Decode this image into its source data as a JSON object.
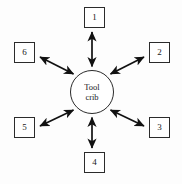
{
  "diagram": {
    "type": "star-network",
    "title": "",
    "background_color": "#fdfdfd",
    "line_color": "#1a1a1a",
    "box_fill": "#ffffff",
    "hub": {
      "shape": "circle",
      "label_line1": "Tool",
      "label_line2": "crib",
      "center_x": 92,
      "center_y": 92,
      "radius": 22
    },
    "nodes": [
      {
        "id": "node-1",
        "label": "1",
        "position": "north",
        "x": 94,
        "y": 18
      },
      {
        "id": "node-2",
        "label": "2",
        "position": "north-east",
        "x": 159,
        "y": 53
      },
      {
        "id": "node-3",
        "label": "3",
        "position": "south-east",
        "x": 159,
        "y": 128
      },
      {
        "id": "node-4",
        "label": "4",
        "position": "south",
        "x": 94,
        "y": 163
      },
      {
        "id": "node-5",
        "label": "5",
        "position": "south-west",
        "x": 24,
        "y": 128
      },
      {
        "id": "node-6",
        "label": "6",
        "position": "north-west",
        "x": 24,
        "y": 53
      }
    ],
    "connectors": [
      {
        "id": "edge-hub-1",
        "from": "hub",
        "to": "node-1",
        "arrow": "double"
      },
      {
        "id": "edge-hub-2",
        "from": "hub",
        "to": "node-2",
        "arrow": "double"
      },
      {
        "id": "edge-hub-3",
        "from": "hub",
        "to": "node-3",
        "arrow": "double"
      },
      {
        "id": "edge-hub-4",
        "from": "hub",
        "to": "node-4",
        "arrow": "double"
      },
      {
        "id": "edge-hub-5",
        "from": "hub",
        "to": "node-5",
        "arrow": "double"
      },
      {
        "id": "edge-hub-6",
        "from": "hub",
        "to": "node-6",
        "arrow": "double"
      }
    ]
  }
}
